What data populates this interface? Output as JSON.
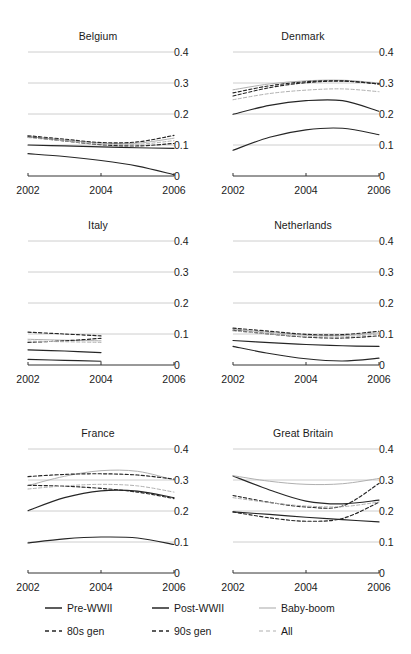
{
  "figure": {
    "layout": "small-multiples 2 columns x 3 rows",
    "panel_order": [
      "Belgium",
      "Denmark",
      "Italy",
      "Netherlands",
      "France",
      "Great Britain"
    ]
  },
  "axis": {
    "y_ticks": [
      "0",
      "0.1",
      "0.2",
      "0.3",
      "0.4"
    ],
    "x_ticks": [
      "2002",
      "2004",
      "2006"
    ]
  },
  "legend": {
    "items": [
      {
        "label": "Pre-WWII",
        "style": "solid",
        "color": "#262626"
      },
      {
        "label": "Post-WWII",
        "style": "solid",
        "color": "#262626"
      },
      {
        "label": "Baby-boom",
        "style": "solid",
        "color": "#b0b0b0"
      },
      {
        "label": "80s gen",
        "style": "dashed",
        "color": "#262626"
      },
      {
        "label": "90s gen",
        "style": "dashed",
        "color": "#262626"
      },
      {
        "label": "All",
        "style": "dashed",
        "color": "#b0b0b0"
      }
    ]
  },
  "chart_data": {
    "type": "line",
    "title": "",
    "xlabel": "",
    "ylabel": "",
    "xlim": [
      2002,
      2006
    ],
    "ylim": [
      0,
      0.4
    ],
    "x": [
      2002,
      2003,
      2004,
      2005,
      2006
    ],
    "xticks": [
      2002,
      2004,
      2006
    ],
    "yticks": [
      0,
      0.1,
      0.2,
      0.3,
      0.4
    ],
    "grid": true,
    "grid_axis": "y",
    "legend_position": "bottom",
    "tick_label_side": "right",
    "panels": [
      {
        "name": "Belgium",
        "series": [
          {
            "name": "Pre-WWII",
            "style": "solid",
            "color": "#262626",
            "values": [
              0.1,
              0.097,
              0.094,
              0.091,
              0.089
            ]
          },
          {
            "name": "Post-WWII",
            "style": "solid",
            "color": "#262626",
            "values": [
              0.072,
              0.063,
              0.05,
              0.032,
              0.004
            ]
          },
          {
            "name": "Baby-boom",
            "style": "solid",
            "color": "#b0b0b0",
            "values": [
              0.127,
              0.116,
              0.106,
              0.106,
              0.122
            ]
          },
          {
            "name": "80s gen",
            "style": "dashed",
            "color": "#262626",
            "values": [
              0.13,
              0.119,
              0.108,
              0.11,
              0.131
            ]
          },
          {
            "name": "90s gen",
            "style": "dashed",
            "color": "#262626",
            "values": [
              0.126,
              0.113,
              0.101,
              0.097,
              0.105
            ]
          },
          {
            "name": "All",
            "style": "dashed",
            "color": "#b0b0b0",
            "values": [
              0.124,
              0.113,
              0.103,
              0.102,
              0.114
            ]
          }
        ]
      },
      {
        "name": "Denmark",
        "series": [
          {
            "name": "Pre-WWII",
            "style": "solid",
            "color": "#262626",
            "values": [
              0.199,
              0.228,
              0.243,
              0.243,
              0.209
            ]
          },
          {
            "name": "Post-WWII",
            "style": "solid",
            "color": "#262626",
            "values": [
              0.083,
              0.125,
              0.149,
              0.154,
              0.133
            ]
          },
          {
            "name": "Baby-boom",
            "style": "solid",
            "color": "#b0b0b0",
            "values": [
              0.278,
              0.297,
              0.307,
              0.309,
              0.3
            ]
          },
          {
            "name": "80s gen",
            "style": "dashed",
            "color": "#262626",
            "values": [
              0.258,
              0.285,
              0.301,
              0.306,
              0.297
            ]
          },
          {
            "name": "90s gen",
            "style": "dashed",
            "color": "#262626",
            "values": [
              0.268,
              0.291,
              0.304,
              0.307,
              0.297
            ]
          },
          {
            "name": "All",
            "style": "dashed",
            "color": "#b0b0b0",
            "values": [
              0.246,
              0.266,
              0.277,
              0.281,
              0.272
            ]
          }
        ]
      },
      {
        "name": "Italy",
        "x_extent": [
          2002,
          2004
        ],
        "series": [
          {
            "name": "Pre-WWII",
            "style": "solid",
            "color": "#262626",
            "values": [
              0.049,
              0.045,
              0.04
            ]
          },
          {
            "name": "Post-WWII",
            "style": "solid",
            "color": "#262626",
            "values": [
              0.018,
              0.015,
              0.012
            ]
          },
          {
            "name": "Baby-boom",
            "style": "solid",
            "color": "#b0b0b0",
            "values": [
              0.083,
              0.08,
              0.078
            ]
          },
          {
            "name": "80s gen",
            "style": "dashed",
            "color": "#262626",
            "values": [
              0.106,
              0.1,
              0.094
            ]
          },
          {
            "name": "90s gen",
            "style": "dashed",
            "color": "#262626",
            "values": [
              0.073,
              0.078,
              0.086
            ]
          },
          {
            "name": "All",
            "style": "dashed",
            "color": "#b0b0b0",
            "values": [
              0.077,
              0.075,
              0.073
            ]
          }
        ]
      },
      {
        "name": "Netherlands",
        "series": [
          {
            "name": "Pre-WWII",
            "style": "solid",
            "color": "#262626",
            "values": [
              0.079,
              0.072,
              0.066,
              0.062,
              0.06
            ]
          },
          {
            "name": "Post-WWII",
            "style": "solid",
            "color": "#262626",
            "values": [
              0.06,
              0.037,
              0.02,
              0.013,
              0.022
            ]
          },
          {
            "name": "Baby-boom",
            "style": "solid",
            "color": "#b0b0b0",
            "values": [
              0.115,
              0.105,
              0.096,
              0.095,
              0.104
            ]
          },
          {
            "name": "80s gen",
            "style": "dashed",
            "color": "#262626",
            "values": [
              0.119,
              0.109,
              0.099,
              0.098,
              0.109
            ]
          },
          {
            "name": "90s gen",
            "style": "dashed",
            "color": "#262626",
            "values": [
              0.112,
              0.1,
              0.09,
              0.087,
              0.094
            ]
          },
          {
            "name": "All",
            "style": "dashed",
            "color": "#b0b0b0",
            "values": [
              0.11,
              0.1,
              0.092,
              0.091,
              0.1
            ]
          }
        ]
      },
      {
        "name": "France",
        "series": [
          {
            "name": "Pre-WWII",
            "style": "solid",
            "color": "#262626",
            "values": [
              0.201,
              0.243,
              0.265,
              0.264,
              0.243
            ]
          },
          {
            "name": "Post-WWII",
            "style": "solid",
            "color": "#262626",
            "values": [
              0.097,
              0.11,
              0.116,
              0.113,
              0.092
            ]
          },
          {
            "name": "Baby-boom",
            "style": "solid",
            "color": "#b0b0b0",
            "values": [
              0.282,
              0.312,
              0.33,
              0.328,
              0.3
            ]
          },
          {
            "name": "80s gen",
            "style": "dashed",
            "color": "#262626",
            "values": [
              0.311,
              0.318,
              0.32,
              0.316,
              0.303
            ]
          },
          {
            "name": "90s gen",
            "style": "dashed",
            "color": "#262626",
            "values": [
              0.283,
              0.28,
              0.273,
              0.261,
              0.24
            ]
          },
          {
            "name": "All",
            "style": "dashed",
            "color": "#b0b0b0",
            "values": [
              0.271,
              0.281,
              0.286,
              0.281,
              0.261
            ]
          }
        ]
      },
      {
        "name": "Great Britain",
        "series": [
          {
            "name": "Pre-WWII",
            "style": "solid",
            "color": "#262626",
            "values": [
              0.313,
              0.268,
              0.232,
              0.223,
              0.235
            ]
          },
          {
            "name": "Post-WWII",
            "style": "solid",
            "color": "#262626",
            "values": [
              0.197,
              0.189,
              0.18,
              0.172,
              0.165
            ]
          },
          {
            "name": "Baby-boom",
            "style": "solid",
            "color": "#b0b0b0",
            "values": [
              0.314,
              0.296,
              0.286,
              0.288,
              0.305
            ]
          },
          {
            "name": "80s gen",
            "style": "dashed",
            "color": "#262626",
            "values": [
              0.25,
              0.228,
              0.213,
              0.216,
              0.289
            ]
          },
          {
            "name": "90s gen",
            "style": "dashed",
            "color": "#262626",
            "values": [
              0.197,
              0.178,
              0.167,
              0.176,
              0.228
            ]
          },
          {
            "name": "All",
            "style": "dashed",
            "color": "#b0b0b0",
            "values": [
              0.243,
              0.227,
              0.216,
              0.214,
              0.229
            ]
          }
        ]
      }
    ]
  }
}
